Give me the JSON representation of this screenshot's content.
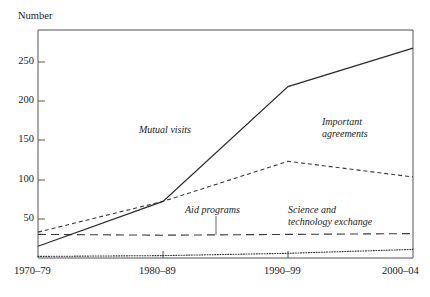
{
  "chart_data": {
    "type": "line",
    "title": "",
    "ylabel": "Number",
    "xlabel": "",
    "grid": false,
    "legend_position": "inline-annotations",
    "categories": [
      "1970–79",
      "1980–89",
      "1990–99",
      "2000–04"
    ],
    "yticks": [
      50,
      100,
      150,
      200,
      250
    ],
    "ylim": [
      0,
      290
    ],
    "series": [
      {
        "name": "Mutual visits",
        "style": "solid",
        "values": [
          15,
          72,
          218,
          267
        ]
      },
      {
        "name": "Important agreements",
        "style": "short-dash",
        "values": [
          33,
          72,
          123,
          103
        ]
      },
      {
        "name": "Aid programs",
        "style": "long-dash",
        "values": [
          30,
          29,
          30,
          31
        ]
      },
      {
        "name": "Science and technology exchange",
        "style": "dotted",
        "values": [
          2,
          3,
          6,
          11
        ]
      }
    ],
    "annotations": [
      {
        "text": "Mutual visits",
        "series": "Mutual visits"
      },
      {
        "text_line1": "Important",
        "text_line2": "agreements",
        "series": "Important agreements"
      },
      {
        "text": "Aid programs",
        "series": "Aid programs"
      },
      {
        "text_line1": "Science and",
        "text_line2": "technology exchange",
        "series": "Science and technology exchange"
      }
    ]
  },
  "axis": {
    "y_title": "Number",
    "y_tick_250": "250",
    "y_tick_200": "200",
    "y_tick_150": "150",
    "y_tick_100": "100",
    "y_tick_50": "50",
    "x_tick_0": "1970–79",
    "x_tick_1": "1980–89",
    "x_tick_2": "1990–99",
    "x_tick_3": "2000–04"
  },
  "labels": {
    "mutual_visits": "Mutual visits",
    "important_agreements_l1": "Important",
    "important_agreements_l2": "agreements",
    "aid_programs": "Aid programs",
    "science_tech_l1": "Science and",
    "science_tech_l2": "technology exchange"
  },
  "colors": {
    "line": "#2b2b2b",
    "axis": "#555555",
    "text": "#1a1a1a",
    "background": "#ffffff"
  }
}
